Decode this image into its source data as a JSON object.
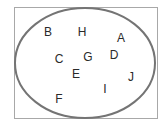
{
  "diagram": {
    "type": "set-diagram",
    "universe": {
      "shape": "rectangle",
      "border_color": "#a8a8a8"
    },
    "set": {
      "shape": "ellipse",
      "stroke_color": "#747474",
      "cx": 85,
      "cy": 63,
      "rx": 70,
      "ry": 55
    },
    "text_color": "#2a2a2a",
    "elements": [
      {
        "label": "B",
        "x": 48,
        "y": 32
      },
      {
        "label": "H",
        "x": 82,
        "y": 32
      },
      {
        "label": "A",
        "x": 121,
        "y": 38
      },
      {
        "label": "C",
        "x": 59,
        "y": 59
      },
      {
        "label": "G",
        "x": 88,
        "y": 57
      },
      {
        "label": "D",
        "x": 114,
        "y": 55
      },
      {
        "label": "E",
        "x": 76,
        "y": 74
      },
      {
        "label": "J",
        "x": 131,
        "y": 77
      },
      {
        "label": "I",
        "x": 105,
        "y": 89
      },
      {
        "label": "F",
        "x": 59,
        "y": 99
      }
    ]
  }
}
